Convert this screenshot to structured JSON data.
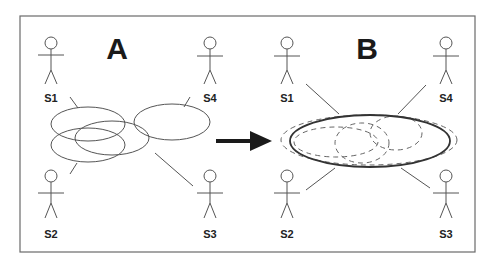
{
  "panels": {
    "left": {
      "label": "A"
    },
    "right": {
      "label": "B"
    }
  },
  "actors": {
    "left": [
      {
        "id": "S1",
        "label": "S1"
      },
      {
        "id": "S4",
        "label": "S4"
      },
      {
        "id": "S2",
        "label": "S2"
      },
      {
        "id": "S3",
        "label": "S3"
      }
    ],
    "right": [
      {
        "id": "S1",
        "label": "S1"
      },
      {
        "id": "S4",
        "label": "S4"
      },
      {
        "id": "S2",
        "label": "S2"
      },
      {
        "id": "S3",
        "label": "S3"
      }
    ]
  },
  "arrow": {
    "direction": "right",
    "color": "#1a1a1a"
  },
  "colors": {
    "stroke": "#555555",
    "frame": "#6a6a6a",
    "background": "#ffffff"
  }
}
